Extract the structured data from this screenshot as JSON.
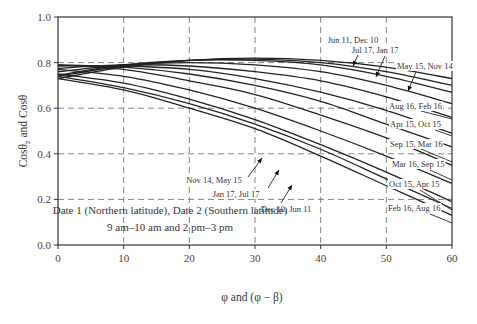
{
  "chart_data": {
    "type": "line",
    "title": "",
    "xlabel": "φ and (φ − β)",
    "ylabel": "Cosθz and Cosθ",
    "xlim": [
      0,
      60
    ],
    "ylim": [
      0.0,
      1.0
    ],
    "xticks": [
      0,
      10,
      20,
      30,
      40,
      50,
      60
    ],
    "yticks": [
      0.0,
      0.2,
      0.4,
      0.6,
      0.8,
      1.0
    ],
    "xtick_labels": [
      "0",
      "10",
      "20",
      "30",
      "40",
      "50",
      "60"
    ],
    "ytick_labels": [
      "0.0",
      "0.2",
      "0.4",
      "0.6",
      "0.8",
      "1.0"
    ],
    "grid": true,
    "grid_style": "dashed",
    "x": [
      0,
      10,
      20,
      30,
      40,
      50,
      60
    ],
    "series": [
      {
        "name": "Jun 11, Dec 10",
        "values": [
          0.73,
          0.78,
          0.81,
          0.82,
          0.81,
          0.78,
          0.73
        ]
      },
      {
        "name": "Jul 17, Jan 17",
        "values": [
          0.74,
          0.785,
          0.81,
          0.815,
          0.8,
          0.76,
          0.7
        ]
      },
      {
        "name": "May 15, Nov 14",
        "values": [
          0.745,
          0.79,
          0.81,
          0.81,
          0.79,
          0.74,
          0.67
        ]
      },
      {
        "name": "Aug 16, Feb 16",
        "values": [
          0.76,
          0.79,
          0.8,
          0.79,
          0.76,
          0.7,
          0.62
        ]
      },
      {
        "name": "Apr 15, Oct 15",
        "values": [
          0.775,
          0.79,
          0.785,
          0.76,
          0.72,
          0.65,
          0.56
        ]
      },
      {
        "name": "Sep 15, Mar 16",
        "values": [
          0.785,
          0.785,
          0.77,
          0.73,
          0.67,
          0.59,
          0.49
        ]
      },
      {
        "name": "Mar 16, Sep 15",
        "values": [
          0.79,
          0.78,
          0.75,
          0.7,
          0.63,
          0.53,
          0.43
        ]
      },
      {
        "name": "Oct 15, Apr 15",
        "values": [
          0.79,
          0.77,
          0.72,
          0.66,
          0.57,
          0.47,
          0.35
        ]
      },
      {
        "name": "Feb 16, Aug 16",
        "values": [
          0.77,
          0.74,
          0.68,
          0.6,
          0.5,
          0.39,
          0.27
        ]
      },
      {
        "name": "Nov 14, May 15",
        "values": [
          0.75,
          0.71,
          0.64,
          0.55,
          0.44,
          0.32,
          0.19
        ]
      },
      {
        "name": "Jan 17, Jul 17",
        "values": [
          0.74,
          0.69,
          0.62,
          0.53,
          0.42,
          0.29,
          0.16
        ]
      },
      {
        "name": "Dec 10, Jun 11",
        "values": [
          0.73,
          0.68,
          0.6,
          0.51,
          0.39,
          0.26,
          0.13
        ]
      }
    ],
    "annotations": [
      "Jun 11, Dec 10",
      "Jul 17, Jan 17",
      "May 15, Nov 14",
      "Aug 16, Feb 16",
      "Apr 15, Oct 15",
      "Sep 15, Mar 16",
      "Mar 16, Sep 15",
      "Oct 15, Apr 15",
      "Feb 16, Aug 16",
      "Nov 14, May 15",
      "Jan 17, Jul 17",
      "Dec 10, Jun 11"
    ],
    "notes": [
      "Date 1 (Northern latitude), Date 2 (Southern latitude)",
      "9 am–10 am  and  2 pm–3 pm"
    ],
    "legend": "none (inline annotations)"
  },
  "labels": {
    "xlabel": "φ and (φ − β)",
    "ylabel_main": "Cosθ",
    "ylabel_sub": "z",
    "ylabel_rest": " and Cosθ",
    "note1": "Date 1 (Northern latitude), Date 2 (Southern latitude)",
    "note2": "9 am–10 am  and  2 pm–3 pm"
  },
  "style": {
    "line_color": "#222222",
    "grid_color": "#777777",
    "axis_color": "#333333"
  }
}
